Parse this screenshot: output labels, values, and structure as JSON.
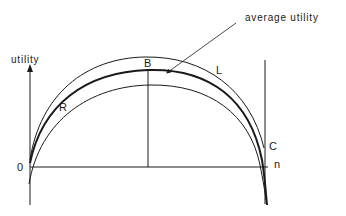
{
  "diagram": {
    "annotation": "average utility",
    "y_axis_label": "utility",
    "x_axis_label": "n",
    "origin_label": "0",
    "points": {
      "B": "B",
      "C": "C"
    },
    "curves": {
      "upper": "L",
      "lower": "R",
      "middle": "average utility"
    },
    "colors": {
      "ink": "#1a1a1a",
      "background": "#ffffff"
    }
  }
}
